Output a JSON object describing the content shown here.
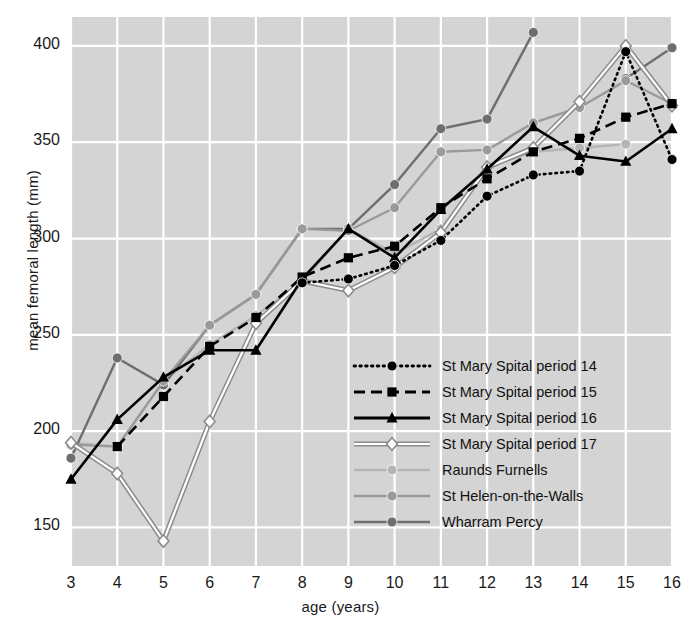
{
  "chart_data": {
    "type": "line",
    "title": "",
    "xlabel": "age (years)",
    "ylabel": "mean femoral length (mm)",
    "x": [
      3,
      4,
      5,
      6,
      7,
      8,
      9,
      10,
      11,
      12,
      13,
      14,
      15,
      16
    ],
    "xlim": [
      3,
      16
    ],
    "ylim": [
      130,
      415
    ],
    "yticks": [
      150,
      200,
      250,
      300,
      350,
      400
    ],
    "xticks": [
      3,
      4,
      5,
      6,
      7,
      8,
      9,
      10,
      11,
      12,
      13,
      14,
      15,
      16
    ],
    "grid": true,
    "legend_position": "center-right",
    "series": [
      {
        "name": "St Mary Spital period 14",
        "style": "dotted",
        "marker": "circle",
        "color": "#000000",
        "values": [
          null,
          null,
          null,
          null,
          null,
          277,
          279,
          286,
          299,
          322,
          333,
          335,
          397,
          341
        ]
      },
      {
        "name": "St Mary Spital period 15",
        "style": "dashed",
        "marker": "square",
        "color": "#000000",
        "values": [
          null,
          192,
          218,
          244,
          259,
          280,
          290,
          296,
          316,
          331,
          345,
          352,
          363,
          370
        ]
      },
      {
        "name": "St Mary Spital period 16",
        "style": "solid",
        "marker": "triangle",
        "color": "#000000",
        "values": [
          175,
          206,
          228,
          242,
          242,
          279,
          305,
          290,
          315,
          336,
          358,
          343,
          340,
          357
        ]
      },
      {
        "name": "St Mary Spital period 17",
        "style": "double-line",
        "marker": "diamond-open",
        "color": "#8c8c8c",
        "values": [
          194,
          178,
          143,
          205,
          256,
          278,
          273,
          285,
          303,
          337,
          347,
          371,
          400,
          369
        ]
      },
      {
        "name": "Raunds Furnells",
        "style": "solid",
        "marker": "circle",
        "color": "#b5b5b5",
        "values": [
          194,
          192,
          226,
          245,
          260,
          278,
          305,
          292,
          305,
          337,
          345,
          347,
          349,
          null
        ]
      },
      {
        "name": "St Helen-on-the-Walls",
        "style": "solid",
        "marker": "circle",
        "color": "#9a9a9a",
        "values": [
          193,
          192,
          226,
          255,
          271,
          305,
          304,
          316,
          345,
          346,
          360,
          368,
          382,
          370
        ]
      },
      {
        "name": "Wharram Percy",
        "style": "solid",
        "marker": "circle",
        "color": "#6e6e6e",
        "values": [
          186,
          238,
          224,
          255,
          271,
          305,
          305,
          328,
          357,
          362,
          407,
          null,
          383,
          399
        ]
      }
    ]
  },
  "legend": {
    "items": [
      {
        "label": "St Mary Spital period 14"
      },
      {
        "label": "St Mary Spital period 15"
      },
      {
        "label": "St Mary Spital period 16"
      },
      {
        "label": "St Mary Spital period 17"
      },
      {
        "label": "Raunds Furnells"
      },
      {
        "label": "St Helen-on-the-Walls"
      },
      {
        "label": "Wharram Percy"
      }
    ]
  },
  "colors": {
    "plot_background": "#d4d4d4",
    "gridline": "#ffffff",
    "text": "#1a1a1a"
  }
}
